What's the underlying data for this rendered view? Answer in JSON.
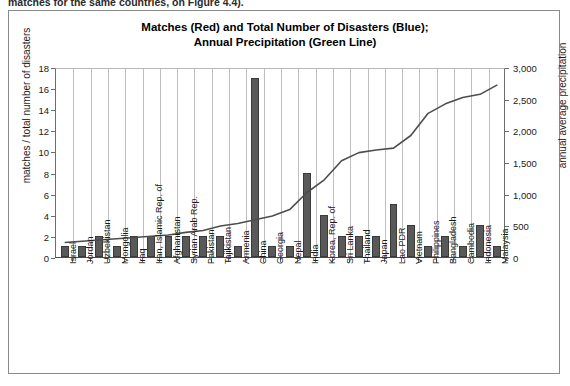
{
  "page": {
    "cutoff_text": "matches for the same countries, on Figure 4.4).",
    "figure_border_color": "#8a8a8a"
  },
  "chart_data": {
    "type": "bar",
    "title": "Matches (Red) and Total Number of Disasters (Blue); Annual Precipitation (Green Line)",
    "title_line1": "Matches (Red) and Total Number of Disasters (Blue);",
    "title_line2": "Annual Precipitation (Green Line)",
    "xlabel": "",
    "ylabel": "matches / total number of disasters",
    "ylabel_secondary": "annual average precipitation",
    "ylim": [
      0,
      18
    ],
    "yticks": [
      "0",
      "2",
      "4",
      "6",
      "8",
      "10",
      "12",
      "14",
      "16",
      "18"
    ],
    "ylim_secondary": [
      0,
      3000
    ],
    "yticks_secondary": [
      "0",
      "500",
      "1,000",
      "1,500",
      "2,000",
      "2,500",
      "3,000"
    ],
    "grid": "vertical",
    "legend": "none",
    "bar_color": "#595959",
    "line_color": "#4d4d4d",
    "categories": [
      "Israel",
      "Jordan",
      "Uzbekistan",
      "Mongolia",
      "Iraq",
      "Iran, Islamic Rep. of",
      "Afghanistan",
      "Syrian Arab Rep.",
      "Pakistan",
      "Tajikistan",
      "Armenia",
      "China",
      "Georgia",
      "Nepal",
      "India",
      "Korea, Rep. of",
      "Sri Lanka",
      "Thailand",
      "Japan",
      "Lao PDR",
      "Vietnam",
      "Philippines",
      "Bangladesh",
      "Cambodia",
      "Indonesia",
      "Malaysia"
    ],
    "series": [
      {
        "name": "matches / total number of disasters",
        "axis": "left",
        "values": [
          1,
          1,
          2,
          1,
          2,
          2,
          2,
          2,
          2,
          2,
          1,
          17,
          1,
          1,
          8,
          4,
          2,
          2,
          2,
          5,
          3,
          1,
          2,
          1,
          3,
          1
        ]
      },
      {
        "name": "annual average precipitation",
        "axis": "right",
        "type": "line",
        "values": [
          260,
          280,
          300,
          320,
          340,
          360,
          380,
          420,
          450,
          520,
          560,
          620,
          680,
          780,
          1050,
          1250,
          1550,
          1680,
          1720,
          1750,
          1950,
          2300,
          2450,
          2550,
          2600,
          2750
        ]
      }
    ]
  }
}
